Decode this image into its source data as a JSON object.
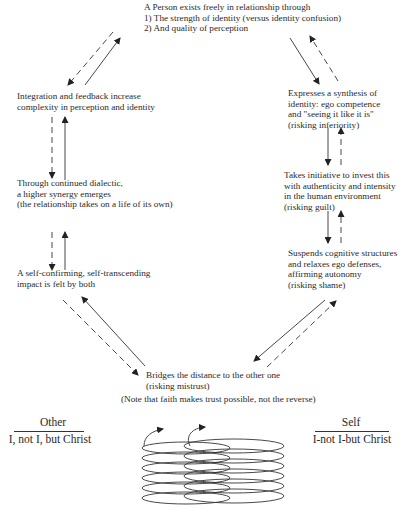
{
  "nodes": {
    "top": {
      "lines": [
        "A Person exists freely in relationship through",
        "1) The strength of identity (versus identity confusion)",
        "2) And quality of perception"
      ]
    },
    "right1": {
      "lines": [
        "Expresses a synthesis of",
        "identity: ego competence",
        "and \"seeing it like it is\"",
        "(risking inferiority)"
      ]
    },
    "right2": {
      "lines": [
        "Takes initiative to invest this",
        "with authenticity and intensity",
        "in the human environment",
        "(risking guilt)"
      ]
    },
    "right3": {
      "lines": [
        "Suspends cognitive structures",
        "and relaxes ego defenses,",
        "affirming autonomy",
        "(risking shame)"
      ]
    },
    "bottom": {
      "lines": [
        "Bridges the distance to the other one",
        "(risking mistrust)"
      ],
      "note": "(Note that faith makes trust possible, not the reverse)"
    },
    "left3": {
      "lines": [
        "A self-confirming, self-transcending",
        "impact is felt by both"
      ]
    },
    "left2": {
      "lines": [
        "Through continued dialectic,",
        "a higher synergy emerges",
        "(the relationship takes on a life of its own)"
      ]
    },
    "left1": {
      "lines": [
        "Integration and feedback increase",
        "complexity in perception and identity"
      ]
    }
  },
  "poles": {
    "other": {
      "title": "Other",
      "subtitle": "I, not I, but Christ"
    },
    "self": {
      "title": "Self",
      "subtitle": "I-not I-but Christ"
    }
  },
  "arrow_legend": {
    "solid": "solid-line arrows",
    "dashed": "dashed-line arrows"
  },
  "colors": {
    "ink": "#2a2a2a",
    "background": "#ffffff"
  }
}
